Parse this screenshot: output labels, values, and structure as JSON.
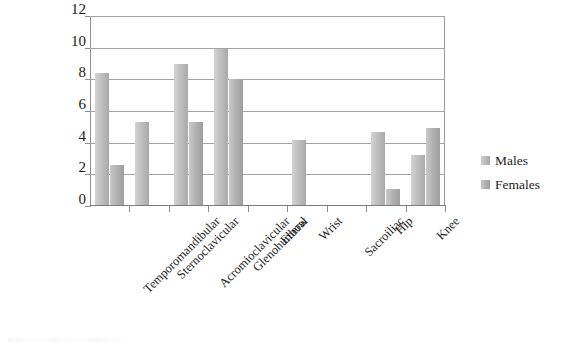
{
  "chart_data": {
    "type": "bar",
    "title": "",
    "subtitle": "",
    "xlabel": "",
    "ylabel": "",
    "ylim": [
      0,
      12
    ],
    "ytick_step": 2,
    "yticks": [
      12,
      10,
      8,
      6,
      4,
      2,
      0
    ],
    "grid": true,
    "legend_position": "right",
    "categories": [
      "Temporomandibular",
      "Sternoclavicular",
      "Acromioclavicular",
      "Glenohumeral",
      "Elbow",
      "Wrist",
      "Sacroiliac",
      "Hip",
      "Knee"
    ],
    "series": [
      {
        "name": "Males",
        "color": "#bdbdbd",
        "values": [
          8.4,
          5.3,
          9.0,
          9.9,
          0,
          4.2,
          0,
          4.7,
          3.2
        ]
      },
      {
        "name": "Females",
        "color": "#b0b0b0",
        "values": [
          2.6,
          0,
          5.3,
          8.0,
          0,
          0,
          0,
          1.1,
          4.9
        ]
      }
    ]
  },
  "legend": {
    "items": [
      {
        "label": "Males"
      },
      {
        "label": "Females"
      }
    ]
  },
  "colors": {
    "background": "#ffffff",
    "gridline": "#a2a2a2",
    "axis": "#8e8e8e",
    "text": "#1c1c1c",
    "males_bar": "#bdbdbd",
    "females_bar": "#b0b0b0"
  }
}
